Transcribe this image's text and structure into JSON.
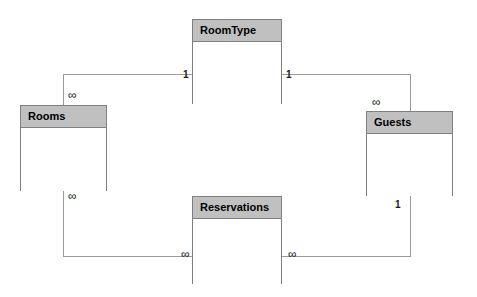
{
  "diagram": {
    "type": "entity-relationship",
    "background_color": "#ffffff",
    "line_color": "#9a9a9a",
    "entity_border_color": "#808080",
    "entity_header_color": "#c0c0c0",
    "entity_body_color": "#ffffff",
    "entities": [
      {
        "id": "roomtype",
        "name": "RoomType",
        "x": 192,
        "y": 19,
        "width": 90,
        "height": 85
      },
      {
        "id": "rooms",
        "name": "Rooms",
        "x": 20,
        "y": 105,
        "width": 87,
        "height": 86
      },
      {
        "id": "guests",
        "name": "Guests",
        "x": 366,
        "y": 111,
        "width": 87,
        "height": 85
      },
      {
        "id": "reservations",
        "name": "Reservations",
        "x": 192,
        "y": 196,
        "width": 90,
        "height": 88
      }
    ],
    "relationships": [
      {
        "id": "roomtype-rooms",
        "from": "roomtype",
        "to": "rooms",
        "from_cardinality": "1",
        "to_cardinality": "∞"
      },
      {
        "id": "roomtype-guests",
        "from": "roomtype",
        "to": "guests",
        "from_cardinality": "1",
        "to_cardinality": "∞"
      },
      {
        "id": "rooms-reservations",
        "from": "rooms",
        "to": "reservations",
        "from_cardinality": "∞",
        "to_cardinality": "∞"
      },
      {
        "id": "guests-reservations",
        "from": "guests",
        "to": "reservations",
        "from_cardinality": "1",
        "to_cardinality": "∞"
      }
    ],
    "cardinality_labels": [
      {
        "id": "roomtype-left",
        "text": "1",
        "x": 183,
        "y": 70,
        "kind": "one"
      },
      {
        "id": "roomtype-right",
        "text": "1",
        "x": 286,
        "y": 70,
        "kind": "one"
      },
      {
        "id": "rooms-top",
        "text": "∞",
        "x": 68,
        "y": 92,
        "kind": "many"
      },
      {
        "id": "rooms-bottom",
        "text": "∞",
        "x": 68,
        "y": 193,
        "kind": "many"
      },
      {
        "id": "guests-top",
        "text": "∞",
        "x": 372,
        "y": 99,
        "kind": "many"
      },
      {
        "id": "guests-bottom",
        "text": "1",
        "x": 395,
        "y": 200,
        "kind": "one"
      },
      {
        "id": "reservations-left",
        "text": "∞",
        "x": 181,
        "y": 250,
        "kind": "many"
      },
      {
        "id": "reservations-right",
        "text": "∞",
        "x": 288,
        "y": 250,
        "kind": "many"
      }
    ]
  }
}
